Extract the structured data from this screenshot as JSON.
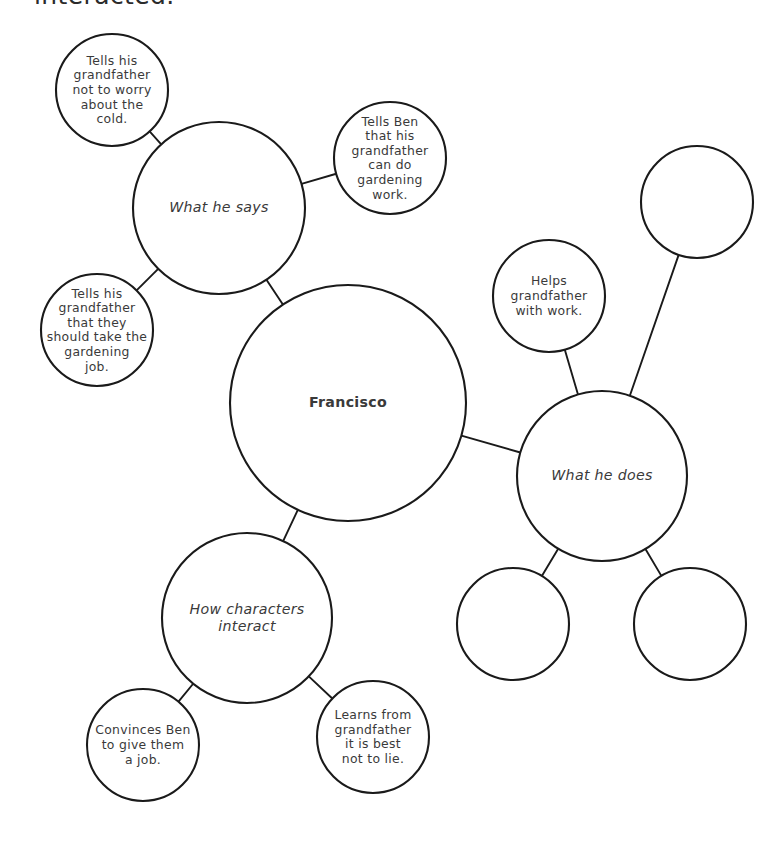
{
  "page": {
    "heading_clipped": "interacted.",
    "background_color": "#ffffff",
    "stroke_color": "#1a1a1a",
    "text_color": "#3a3a3a"
  },
  "chart_data": {
    "type": "diagram",
    "subtype": "bubble-map",
    "center": {
      "id": "francisco",
      "label": "Francisco",
      "cx": 348,
      "cy": 403,
      "r": 118,
      "style": "center"
    },
    "branches": [
      {
        "id": "what-he-says",
        "label": "What he says",
        "cx": 219,
        "cy": 208,
        "r": 86,
        "style": "branch",
        "leaves": [
          {
            "id": "not-to-worry-cold",
            "label": "Tells his grandfather not to worry about the cold.",
            "cx": 112,
            "cy": 90,
            "r": 56,
            "empty": false
          },
          {
            "id": "tells-ben-gardening",
            "label": "Tells Ben that his grandfather can do gardening work.",
            "cx": 390,
            "cy": 158,
            "r": 56,
            "empty": false
          },
          {
            "id": "should-take-job",
            "label": "Tells his grandfather that they should take the gardening job.",
            "cx": 97,
            "cy": 330,
            "r": 56,
            "empty": false
          }
        ]
      },
      {
        "id": "what-he-does",
        "label": "What he does",
        "cx": 602,
        "cy": 476,
        "r": 85,
        "style": "branch",
        "leaves": [
          {
            "id": "helps-grandfather",
            "label": "Helps grandfather with work.",
            "cx": 549,
            "cy": 296,
            "r": 56,
            "empty": false
          },
          {
            "id": "blank-top-right",
            "label": "",
            "cx": 697,
            "cy": 202,
            "r": 56,
            "empty": true
          },
          {
            "id": "blank-bottom-left",
            "label": "",
            "cx": 513,
            "cy": 624,
            "r": 56,
            "empty": true
          },
          {
            "id": "blank-bottom-right",
            "label": "",
            "cx": 690,
            "cy": 624,
            "r": 56,
            "empty": true
          }
        ]
      },
      {
        "id": "how-characters-interact",
        "label": "How characters interact",
        "cx": 247,
        "cy": 618,
        "r": 85,
        "style": "branch",
        "leaves": [
          {
            "id": "convinces-ben",
            "label": "Convinces Ben to give them a job.",
            "cx": 143,
            "cy": 745,
            "r": 56,
            "empty": false
          },
          {
            "id": "learns-not-to-lie",
            "label": "Learns from grandfather it is best not to lie.",
            "cx": 373,
            "cy": 737,
            "r": 56,
            "empty": false
          }
        ]
      }
    ],
    "text_wraps": {
      "francisco": [
        "Francisco"
      ],
      "what-he-says": [
        "What he says"
      ],
      "what-he-does": [
        "What he does"
      ],
      "how-characters-interact": [
        "How characters",
        "interact"
      ],
      "not-to-worry-cold": [
        "Tells his",
        "grandfather",
        "not to worry",
        "about the",
        "cold."
      ],
      "tells-ben-gardening": [
        "Tells Ben",
        "that his",
        "grandfather",
        "can do",
        "gardening",
        "work."
      ],
      "should-take-job": [
        "Tells his",
        "grandfather",
        "that they",
        "should take the",
        "gardening",
        "job."
      ],
      "helps-grandfather": [
        "Helps",
        "grandfather",
        "with work."
      ],
      "convinces-ben": [
        "Convinces Ben",
        "to give them",
        "a job."
      ],
      "learns-not-to-lie": [
        "Learns from",
        "grandfather",
        "it is best",
        "not to lie."
      ]
    }
  }
}
